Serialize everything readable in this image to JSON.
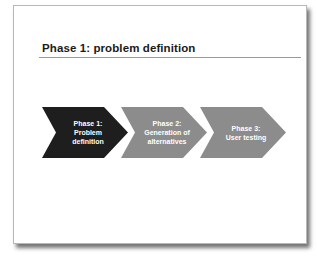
{
  "slide": {
    "title": "Phase 1: problem definition"
  },
  "phases": [
    {
      "line1": "Phase 1:",
      "line2": "Problem",
      "line3": "definition",
      "color": "#1e1e1e",
      "active": true
    },
    {
      "line1": "Phase 2:",
      "line2": "Generation of",
      "line3": "alternatives",
      "color": "#8c8c8c",
      "active": false
    },
    {
      "line1": "Phase 3:",
      "line2": "User testing",
      "line3": "",
      "color": "#8c8c8c",
      "active": false
    }
  ]
}
